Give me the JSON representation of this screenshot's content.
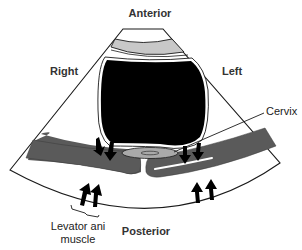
{
  "diagram": {
    "orientation_labels": {
      "top": "Anterior",
      "bottom": "Posterior",
      "left": "Right",
      "right": "Left"
    },
    "annotations": {
      "cervix": "Cervix",
      "levator_line1": "Levator ani",
      "levator_line2": "muscle"
    },
    "structures": [
      {
        "name": "ultrasound-fan-sector",
        "fill": "#ffffff",
        "stroke": "#1a1a1a"
      },
      {
        "name": "superficial-gray-band",
        "fill": "#c8c8c8"
      },
      {
        "name": "bladder",
        "fill": "#000000"
      },
      {
        "name": "cervix",
        "fill": "#a9a9a9"
      },
      {
        "name": "levator-ani-muscle-right",
        "fill": "#5a5a5a"
      },
      {
        "name": "levator-ani-muscle-left",
        "fill": "#5a5a5a"
      }
    ],
    "arrows": {
      "count": 8,
      "description": "Pairs of arrows pressing inward on muscle bands (down from above, up from below) on each side",
      "color": "#000000"
    },
    "colors": {
      "outline": "#1a1a1a",
      "muscle": "#5a5a5a",
      "gray_band": "#c8c8c8",
      "bladder": "#000000",
      "background": "#ffffff"
    }
  }
}
